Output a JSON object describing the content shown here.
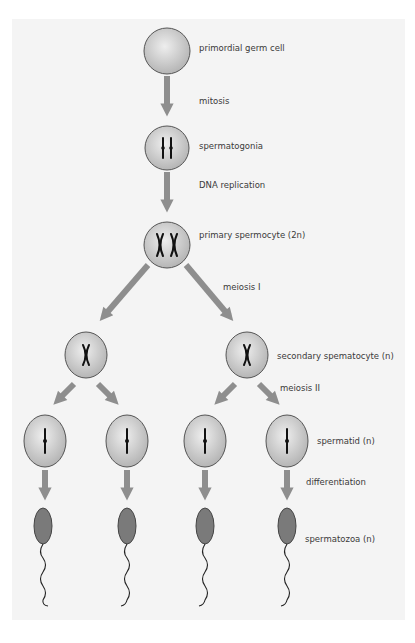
{
  "diagram": {
    "colors": {
      "background": "#ffffff",
      "panel": "#f4f4f4",
      "arrow": "#8e8e8e",
      "cell_fill_light": "#e8e8e8",
      "cell_fill_dark": "#b8b8b8",
      "cell_stroke": "#555555",
      "sperm_head": "#7a7a7a",
      "chromosome": "#111111",
      "text": "#3a3a3a"
    },
    "labels": {
      "primordial": "primordial germ cell",
      "mitosis": "mitosis",
      "spermatogonia": "spermatogonia",
      "dna_replication": "DNA replication",
      "primary": "primary spermocyte (2n)",
      "meiosis1": "meiosis I",
      "secondary": "secondary spematocyte (n)",
      "meiosis2": "meiosis II",
      "spermatid": "spermatid (n)",
      "differentiation": "differentiation",
      "spermatozoa": "spermatozoa (n)"
    },
    "stages": [
      {
        "name": "primordial germ cell",
        "count": 1,
        "chromosomes": "none shown"
      },
      {
        "name": "spermatogonia",
        "count": 1,
        "chromosomes": "2 unreplicated"
      },
      {
        "name": "primary spermocyte (2n)",
        "count": 1,
        "chromosomes": "2 replicated (X shapes)"
      },
      {
        "name": "secondary spematocyte (n)",
        "count": 2,
        "chromosomes": "1 replicated"
      },
      {
        "name": "spermatid (n)",
        "count": 4,
        "chromosomes": "1 single"
      },
      {
        "name": "spermatozoa (n)",
        "count": 4,
        "chromosomes": ""
      }
    ],
    "processes": [
      "mitosis",
      "DNA replication",
      "meiosis I",
      "meiosis II",
      "differentiation"
    ]
  }
}
